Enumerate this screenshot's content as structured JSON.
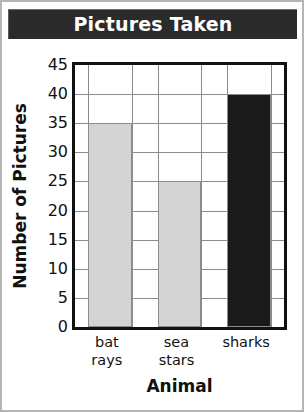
{
  "chart_data": {
    "type": "bar",
    "title": "Pictures Taken",
    "xlabel": "Animal",
    "ylabel": "Number of Pictures",
    "categories": [
      "bat\nrays",
      "sea\nstars",
      "sharks"
    ],
    "values": [
      35,
      25,
      40
    ],
    "ylim": [
      0,
      45
    ],
    "ytick_step": 5,
    "yticks": [
      45,
      40,
      35,
      30,
      25,
      20,
      15,
      10,
      5,
      0
    ],
    "grid": true,
    "legend": "none",
    "bar_colors": [
      "#d4d4d4",
      "#d4d4d4",
      "#1a1a1a"
    ],
    "series": [
      {
        "name": "Pictures Taken",
        "values": [
          35,
          25,
          40
        ]
      }
    ]
  },
  "style": {
    "title_bg": "#2b2b2b",
    "title_fg": "#ffffff",
    "axis_color": "#111111",
    "grid_color": "#8c8c8c",
    "frame_color": "#b5b5b5",
    "plot_bg": "#ffffff",
    "bar_light": "#d4d4d4",
    "bar_dark": "#1a1a1a"
  }
}
